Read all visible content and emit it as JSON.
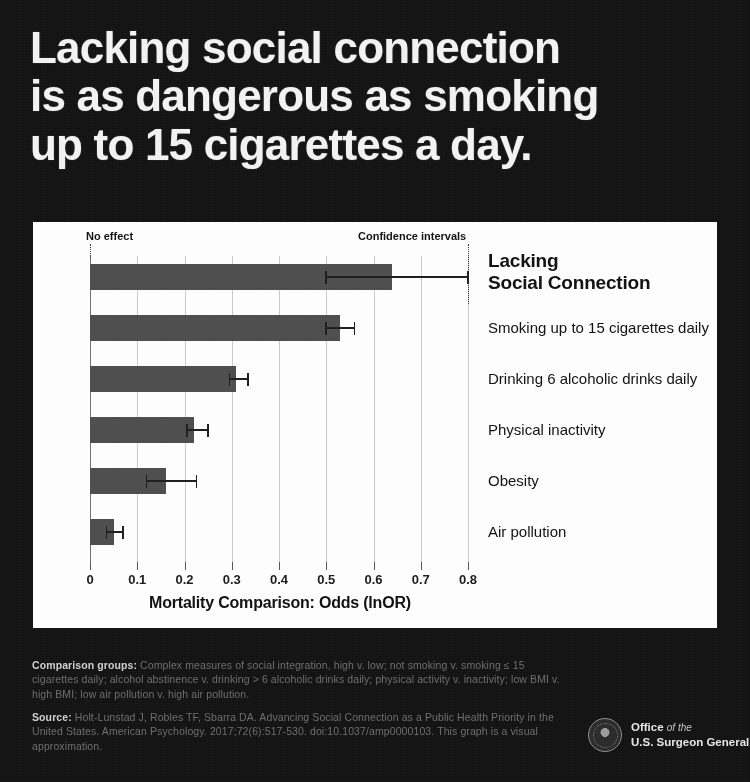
{
  "headline": {
    "lines": [
      "Lacking social connection",
      "is as dangerous as smoking",
      "up to 15 cigarettes a day."
    ]
  },
  "chart_data": {
    "type": "bar",
    "orientation": "horizontal",
    "title": "",
    "xlabel": "Mortality Comparison: Odds (lnOR)",
    "ylabel": "",
    "xlim": [
      0,
      0.8
    ],
    "xticks": [
      "0",
      "0.1",
      "0.2",
      "0.3",
      "0.4",
      "0.5",
      "0.6",
      "0.7",
      "0.8"
    ],
    "xtick_values": [
      0,
      0.1,
      0.2,
      0.3,
      0.4,
      0.5,
      0.6,
      0.7,
      0.8
    ],
    "grid": true,
    "legend": "none",
    "categories": [
      "Lacking Social Connection",
      "Smoking up to 15 cigarettes daily",
      "Drinking 6 alcoholic drinks daily",
      "Physical inactivity",
      "Obesity",
      "Air pollution"
    ],
    "values": [
      0.64,
      0.53,
      0.31,
      0.22,
      0.16,
      0.05
    ],
    "ci_low": [
      0.5,
      0.5,
      0.295,
      0.205,
      0.12,
      0.035
    ],
    "ci_high": [
      0.8,
      0.56,
      0.335,
      0.25,
      0.225,
      0.07
    ],
    "annotations": [
      {
        "label": "No effect",
        "x": 0
      },
      {
        "label": "Confidence intervals",
        "x": 0.8
      }
    ],
    "bar_color": "#4d4d4d",
    "panel_color": "#fdfdfd",
    "background_color": "#121212"
  },
  "footnotes": {
    "comparison_label": "Comparison groups:",
    "comparison_text": " Complex measures of social integration, high v. low; not smoking v. smoking ≤ 15 cigarettes daily; alcohol abstinence v. drinking > 6 alcoholic drinks daily; physical activity v. inactivity; low BMI v. high BMI; low air pollution v. high air pollution.",
    "source_label": "Source:",
    "source_text": " Holt-Lunstad J, Robles TF, Sbarra DA. Advancing Social Connection as a Public Health Priority in the United States. American Psychology. 2017;72(6):517-530. doi:10.1037/amp0000103. This graph is a visual approximation."
  },
  "seal": {
    "line1": "Office",
    "line1_italic": "of the",
    "line2": "U.S. Surgeon General"
  }
}
